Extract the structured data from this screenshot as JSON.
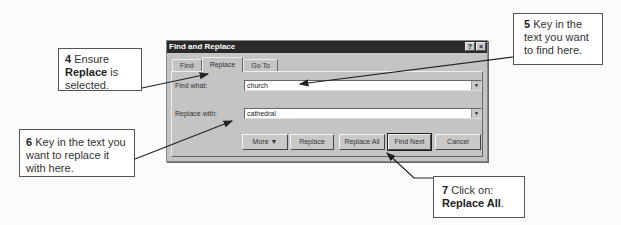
{
  "dialog": {
    "title": "Find and Replace",
    "title_buttons": {
      "help": "?",
      "close": "×"
    },
    "tabs": [
      {
        "label": "Find",
        "active": false
      },
      {
        "label": "Replace",
        "active": true
      },
      {
        "label": "Go To",
        "active": false
      }
    ],
    "find_what": {
      "label": "Find what:",
      "value": "church"
    },
    "replace_with": {
      "label": "Replace with:",
      "value": "cathedral"
    },
    "dropdown_glyph": "▼",
    "buttons": {
      "more": "More ▼",
      "replace": "Replace",
      "replace_all": "Replace All",
      "find_next": "Find Next",
      "cancel": "Cancel"
    }
  },
  "callouts": {
    "step4": {
      "num": "4",
      "pre": "Ensure",
      "bold": "Replace",
      "post": "is selected."
    },
    "step5": {
      "num": "5",
      "text": "Key in the text you want to find here."
    },
    "step6": {
      "num": "6",
      "text": "Key in the text you want to replace it with here."
    },
    "step7": {
      "num": "7",
      "text": "Click on:",
      "bold": "Replace All",
      "post": "."
    }
  },
  "colors": {
    "titlebar": "#2a2a2a",
    "dialog_bg": "#c4c4c4",
    "arrow": "#222222"
  }
}
